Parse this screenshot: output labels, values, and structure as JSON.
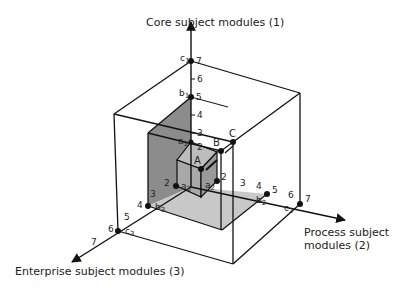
{
  "axes": {
    "axis1": {
      "label": "Core subject modules (1)",
      "ticks": [
        "2",
        "3",
        "4",
        "5",
        "6",
        "7"
      ]
    },
    "axis2": {
      "label_line1": "Process subject",
      "label_line2": "modules (2)",
      "ticks": [
        "2",
        "3",
        "4",
        "5",
        "6",
        "7"
      ]
    },
    "axis3": {
      "label": "Enterprise subject modules (3)",
      "ticks": [
        "2",
        "3",
        "4",
        "5",
        "6",
        "7"
      ]
    }
  },
  "points": {
    "a1": "a",
    "a1_sub": "1",
    "a2": "a",
    "a2_sub": "2",
    "a3": "a",
    "a3_sub": "3",
    "b1": "b",
    "b1_sub": "1",
    "b2": "b",
    "b2_sub": "2",
    "b3": "b",
    "b3_sub": "3",
    "c1": "c",
    "c1_sub": "1",
    "c2": "c",
    "c2_sub": "2",
    "c3": "c",
    "c3_sub": "3"
  },
  "cubes": {
    "A": "A",
    "B": "B",
    "C": "C"
  },
  "colors": {
    "shade_dark": "#8c8c8c",
    "shade_mid": "#a9a9a9",
    "shade_light": "#c8c8c8",
    "line": "#111111"
  }
}
